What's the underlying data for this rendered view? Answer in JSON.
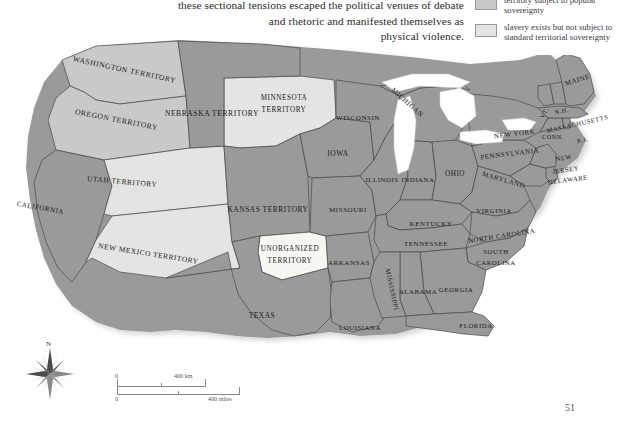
{
  "body_text": {
    "lines": [
      "these sectional tensions escaped the political venues of debate",
      "and rhetoric and manifested themselves as",
      "physical violence."
    ]
  },
  "legend": {
    "items": [
      {
        "label": "area in free state later open to slavery",
        "color": "#8e8e8e"
      },
      {
        "label": "territory subject to popular sovereignty",
        "color": "#c9c9c9"
      },
      {
        "label": "slavery exists but not subject to standard territorial sovereignty",
        "color": "#e4e4e4"
      }
    ]
  },
  "map": {
    "ocean_color": "#ffffff",
    "border_color": "#4a4a4a",
    "colors": {
      "slave_or_state": "#9a9a9a",
      "popular_sovereignty": "#c9c9c9",
      "special_sovereignty": "#e4e4e4",
      "unorganized": "#f7f7f2",
      "lake": "#ffffff"
    },
    "regions": [
      {
        "name": "WASHINGTON TERRITORY",
        "fill": "popular_sovereignty"
      },
      {
        "name": "OREGON TERRITORY",
        "fill": "popular_sovereignty"
      },
      {
        "name": "CALIFORNIA",
        "fill": "slave_or_state"
      },
      {
        "name": "UTAH TERRITORY",
        "fill": "special_sovereignty"
      },
      {
        "name": "NEW MEXICO TERRITORY",
        "fill": "special_sovereignty"
      },
      {
        "name": "MINNESOTA TERRITORY",
        "fill": "special_sovereignty"
      },
      {
        "name": "NEBRASKA TERRITORY",
        "fill": "slave_or_state"
      },
      {
        "name": "KANSAS TERRITORY",
        "fill": "slave_or_state"
      },
      {
        "name": "UNORGANIZED TERRITORY",
        "fill": "unorganized"
      },
      {
        "name": "TEXAS",
        "fill": "slave_or_state"
      },
      {
        "name": "IOWA",
        "fill": "slave_or_state"
      },
      {
        "name": "MISSOURI",
        "fill": "slave_or_state"
      },
      {
        "name": "ARKANSAS",
        "fill": "slave_or_state"
      },
      {
        "name": "LOUISIANA",
        "fill": "slave_or_state"
      },
      {
        "name": "WISCONSIN",
        "fill": "slave_or_state"
      },
      {
        "name": "MICHIGAN",
        "fill": "slave_or_state"
      },
      {
        "name": "ILLINOIS",
        "fill": "slave_or_state"
      },
      {
        "name": "INDIANA",
        "fill": "slave_or_state"
      },
      {
        "name": "OHIO",
        "fill": "slave_or_state"
      },
      {
        "name": "KENTUCKY",
        "fill": "slave_or_state"
      },
      {
        "name": "TENNESSEE",
        "fill": "slave_or_state"
      },
      {
        "name": "MISSISSIPPI",
        "fill": "slave_or_state"
      },
      {
        "name": "ALABAMA",
        "fill": "slave_or_state"
      },
      {
        "name": "GEORGIA",
        "fill": "slave_or_state"
      },
      {
        "name": "FLORIDA",
        "fill": "slave_or_state"
      },
      {
        "name": "SOUTH CAROLINA",
        "fill": "slave_or_state"
      },
      {
        "name": "NORTH CAROLINA",
        "fill": "slave_or_state"
      },
      {
        "name": "VIRGINIA",
        "fill": "slave_or_state"
      },
      {
        "name": "MARYLAND",
        "fill": "slave_or_state"
      },
      {
        "name": "DELAWARE",
        "fill": "slave_or_state"
      },
      {
        "name": "PENNSYLVANIA",
        "fill": "slave_or_state"
      },
      {
        "name": "NEW JERSEY",
        "fill": "slave_or_state"
      },
      {
        "name": "NEW YORK",
        "fill": "slave_or_state"
      },
      {
        "name": "CONN.",
        "fill": "slave_or_state"
      },
      {
        "name": "R.I.",
        "fill": "slave_or_state"
      },
      {
        "name": "MASSACHUSETTS",
        "fill": "slave_or_state"
      },
      {
        "name": "VT.",
        "fill": "slave_or_state"
      },
      {
        "name": "N.H.",
        "fill": "slave_or_state"
      },
      {
        "name": "MAINE",
        "fill": "slave_or_state"
      }
    ],
    "labels": {
      "washington_territory": "WASHINGTON TERRITORY",
      "oregon_territory": "OREGON TERRITORY",
      "california": "CALIFORNIA",
      "utah_territory": "UTAH TERRITORY",
      "new_mexico_territory": "NEW MEXICO TERRITORY",
      "minnesota_territory_l1": "MINNESOTA",
      "minnesota_territory_l2": "TERRITORY",
      "nebraska_territory": "NEBRASKA TERRITORY",
      "kansas_territory": "KANSAS TERRITORY",
      "unorganized_l1": "UNORGANIZED",
      "unorganized_l2": "TERRITORY",
      "texas": "TEXAS",
      "iowa": "IOWA",
      "missouri": "MISSOURI",
      "arkansas": "ARKANSAS",
      "louisiana": "LOUISIANA",
      "wisconsin": "WISCONSIN",
      "michigan": "MICHIGAN",
      "illinois": "ILLINOIS",
      "indiana": "INDIANA",
      "ohio": "OHIO",
      "kentucky": "KENTUCKY",
      "tennessee": "TENNESSEE",
      "mississippi": "MISSISSIPPI",
      "alabama": "ALABAMA",
      "georgia": "GEORGIA",
      "florida": "FLORIDA",
      "south_carolina_l1": "SOUTH",
      "south_carolina_l2": "CAROLINA",
      "north_carolina": "NORTH CAROLINA",
      "virginia": "VIRGINIA",
      "maryland": "MARYLAND",
      "delaware": "DELAWARE",
      "pennsylvania": "PENNSYLVANIA",
      "new_jersey_l1": "NEW",
      "new_jersey_l2": "JERSEY",
      "new_york": "NEW YORK",
      "conn": "CONN.",
      "ri": "R.I.",
      "massachusetts": "MASSACHUSETTS",
      "vt": "VT.",
      "nh": "N.H.",
      "maine": "MAINE"
    }
  },
  "compass": {
    "north_label": "N"
  },
  "scale": {
    "km_zero": "0",
    "km_label": "400 km",
    "miles_zero": "0",
    "miles_label": "400 miles"
  },
  "page_number": "51"
}
